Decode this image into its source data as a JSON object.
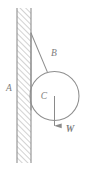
{
  "figure": {
    "type": "physics-free-body-diagram",
    "background_color": "#ffffff",
    "stroke_color": "#8a8a8a",
    "label_color": "#7d7d7d",
    "hatch_color": "#a8a8a8",
    "labels": {
      "wall": "A",
      "string": "B",
      "cylinder_center": "C",
      "weight_force": "W"
    },
    "geometry": {
      "wall": {
        "x": 17,
        "y": 8,
        "width": 14,
        "height": 155,
        "hatch_direction": "lower-left-to-upper-right"
      },
      "string": {
        "anchor_x": 31,
        "anchor_y": 33,
        "tangent_x": 47,
        "tangent_y": 71
      },
      "wall_contact_line": {
        "x": 31,
        "y_top": 33,
        "y_bottom": 110
      },
      "cylinder": {
        "cx": 54.5,
        "cy": 96,
        "r": 24.5
      },
      "weight_arrow": {
        "x": 54.5,
        "y_start": 96,
        "y_end": 133,
        "direction": "down"
      }
    },
    "label_positions": {
      "A": {
        "x": 9,
        "y": 89
      },
      "B": {
        "x": 54,
        "y": 54
      },
      "C": {
        "x": 44,
        "y": 97
      },
      "W": {
        "x": 70,
        "y": 130
      }
    }
  }
}
